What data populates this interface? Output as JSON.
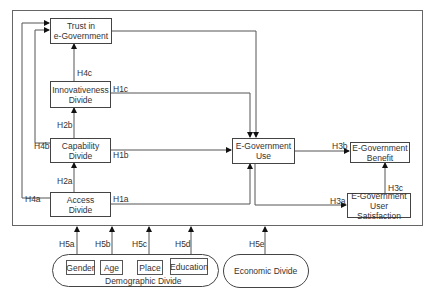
{
  "nodes": {
    "trust": [
      "Trust in",
      "e-Government"
    ],
    "innovativeness": [
      "Innovativeness",
      "Divide"
    ],
    "capability": [
      "Capability",
      "Divide"
    ],
    "access": [
      "Access",
      "Divide"
    ],
    "use": [
      "E-Government",
      "Use"
    ],
    "benefit": [
      "E-Government",
      "Benefit"
    ],
    "satisfaction": [
      "E-Government",
      "User Satisfaction"
    ]
  },
  "demographic": {
    "label": "Demographic Divide",
    "items": [
      "Gender",
      "Age",
      "Place",
      "Education"
    ]
  },
  "economic": {
    "label": "Economic Divide"
  },
  "hypotheses": {
    "H1a": "H1a",
    "H1b": "H1b",
    "H1c": "H1c",
    "H2a": "H2a",
    "H2b": "H2b",
    "H3a": "H3a",
    "H3b": "H3b",
    "H3c": "H3c",
    "H4a": "H4a",
    "H4b": "H4b",
    "H4c": "H4c",
    "H5a": "H5a",
    "H5b": "H5b",
    "H5c": "H5c",
    "H5d": "H5d",
    "H5e": "H5e"
  }
}
